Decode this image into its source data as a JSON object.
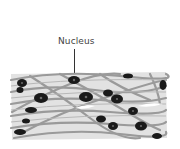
{
  "diagram": {
    "type": "biological tissue illustration",
    "labels": [
      {
        "text": "Nucleus",
        "target": "cell nucleus",
        "position": "top-center"
      }
    ]
  },
  "colors": {
    "background": "#ffffff",
    "tissue_fill": "#e2e2e2",
    "fiber": "#9a9a9a",
    "nucleus": "#1a1a1a",
    "label_text": "#444444"
  }
}
